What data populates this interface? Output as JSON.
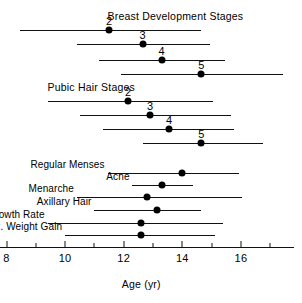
{
  "chart_data": {
    "type": "bar",
    "title": "",
    "xlabel": "Age (yr)",
    "ylabel": "",
    "xlim": [
      7.6,
      17.8
    ],
    "grid": false,
    "legend": null,
    "axis": {
      "label": "Age (yr)",
      "tick_labels": [
        "8",
        "10",
        "12",
        "14",
        "16"
      ],
      "tick_values": [
        8,
        10,
        12,
        14,
        16
      ],
      "minor_tick_values": [
        9,
        11,
        13,
        15,
        17
      ],
      "range_start": 7.6,
      "range_end": 17.8
    },
    "groups": [
      {
        "name": "breast-development-stages",
        "title": "Breast Development Stages",
        "title_x": 11.45,
        "title_align": "left",
        "rows": [
          {
            "label": "2",
            "start": 8.45,
            "mean": 11.5,
            "end": 14.65,
            "label_x": 11.5
          },
          {
            "label": "3",
            "start": 10.4,
            "mean": 12.65,
            "end": 14.95,
            "label_x": 12.65
          },
          {
            "label": "4",
            "start": 11.15,
            "mean": 13.3,
            "end": 15.45,
            "label_x": 13.3
          },
          {
            "label": "5",
            "start": 11.9,
            "mean": 14.65,
            "end": 17.45,
            "label_x": 14.65
          }
        ]
      },
      {
        "name": "pubic-hair-stages",
        "title": "Pubic Hair Stages",
        "title_x": 9.4,
        "title_align": "left",
        "rows": [
          {
            "label": "2",
            "start": 9.4,
            "mean": 12.15,
            "end": 15.05,
            "label_x": 12.15
          },
          {
            "label": "3",
            "start": 10.5,
            "mean": 12.9,
            "end": 15.65,
            "label_x": 12.9
          },
          {
            "label": "4",
            "start": 11.3,
            "mean": 13.55,
            "end": 15.75,
            "label_x": 13.55
          },
          {
            "label": "5",
            "start": 12.65,
            "mean": 14.65,
            "end": 16.75,
            "label_x": 14.65
          }
        ]
      },
      {
        "name": "pubertal-events",
        "title": "",
        "rows": [
          {
            "label": "Regular Menses",
            "start": 11.45,
            "mean": 14.0,
            "end": 15.95,
            "label_x": 11.35
          },
          {
            "label": "Acne",
            "start": 12.3,
            "mean": 13.3,
            "end": 14.35,
            "label_x": 12.2
          },
          {
            "label": "Menarche",
            "start": 10.4,
            "mean": 12.8,
            "end": 16.05,
            "label_x": 10.3
          },
          {
            "label": "Axillary Hair",
            "start": 11.0,
            "mean": 13.15,
            "end": 14.65,
            "label_x": 10.9
          },
          {
            "label": "Max. Growth Rate",
            "start": 9.4,
            "mean": 12.6,
            "end": 15.4,
            "label_x": 9.3
          },
          {
            "label": "Max. Weight Gain",
            "start": 10.0,
            "mean": 12.6,
            "end": 15.1,
            "label_x": 9.9
          }
        ]
      }
    ]
  },
  "colors": {
    "ink": "#111111",
    "background": "#ffffff"
  }
}
